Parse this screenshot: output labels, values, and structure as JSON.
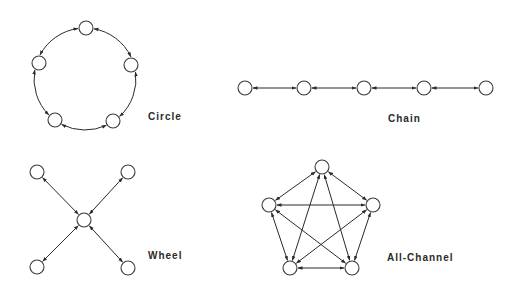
{
  "diagram": {
    "title": "",
    "networks": [
      {
        "id": "circle",
        "label": "Circle",
        "label_pos": [
          148,
          111
        ],
        "nodes": [
          [
            86,
            28
          ],
          [
            131,
            65
          ],
          [
            113,
            121
          ],
          [
            55,
            120
          ],
          [
            39,
            63
          ]
        ],
        "edges": [],
        "curved_ring": {
          "cx": 85,
          "cy": 79,
          "r": 51
        }
      },
      {
        "id": "chain",
        "label": "Chain",
        "label_pos": [
          388,
          113
        ],
        "nodes": [
          [
            245,
            88
          ],
          [
            304,
            88
          ],
          [
            364,
            88
          ],
          [
            424,
            88
          ],
          [
            486,
            88
          ]
        ],
        "edges": [
          [
            0,
            1
          ],
          [
            1,
            2
          ],
          [
            2,
            3
          ],
          [
            3,
            4
          ]
        ]
      },
      {
        "id": "wheel",
        "label": "Wheel",
        "label_pos": [
          148,
          250
        ],
        "nodes": [
          [
            84,
            220
          ],
          [
            37,
            172
          ],
          [
            128,
            172
          ],
          [
            37,
            267
          ],
          [
            128,
            268
          ]
        ],
        "edges": [
          [
            0,
            1
          ],
          [
            0,
            2
          ],
          [
            0,
            3
          ],
          [
            0,
            4
          ]
        ]
      },
      {
        "id": "all-channel",
        "label": "All-Channel",
        "label_pos": [
          387,
          252
        ],
        "nodes": [
          [
            322,
            167
          ],
          [
            373,
            205
          ],
          [
            352,
            268
          ],
          [
            290,
            268
          ],
          [
            269,
            205
          ]
        ],
        "edges": [
          [
            0,
            1
          ],
          [
            0,
            2
          ],
          [
            0,
            3
          ],
          [
            0,
            4
          ],
          [
            1,
            2
          ],
          [
            1,
            3
          ],
          [
            1,
            4
          ],
          [
            2,
            3
          ],
          [
            2,
            4
          ],
          [
            3,
            4
          ]
        ]
      }
    ],
    "node_radius": 7,
    "arrow_style": "bidirectional",
    "colors": {
      "stroke": "#2a2a2a",
      "node_fill": "#ffffff",
      "background": "#ffffff"
    }
  }
}
